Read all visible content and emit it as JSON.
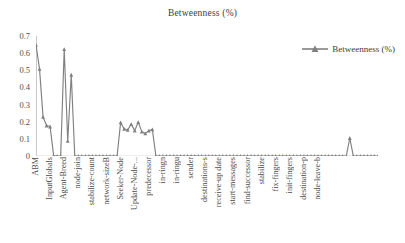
{
  "chart_data": {
    "type": "line",
    "title": "Betweenness (%)",
    "xlabel": "",
    "ylabel": "",
    "ylim": [
      0,
      0.7
    ],
    "ytick_values": [
      0,
      0.1,
      0.2,
      0.3,
      0.4,
      0.5,
      0.6,
      0.7
    ],
    "ytick_labels": [
      "0",
      "0.1",
      "0.2",
      "0.3",
      "0.4",
      "0.5",
      "0.6",
      "0.7"
    ],
    "grid": false,
    "legend_position": "top-right",
    "series": [
      {
        "name": "Betweenness (%)",
        "color": "#808080",
        "marker": "triangle",
        "values": [
          0.648,
          0.508,
          0.228,
          0.178,
          0.172,
          0.002,
          0.0,
          0.0,
          0.624,
          0.088,
          0.474,
          0.0,
          0.0,
          0.0,
          0.0,
          0.0,
          0.0,
          0.0,
          0.0,
          0.0,
          0.0,
          0.0,
          0.0,
          0.0,
          0.196,
          0.158,
          0.152,
          0.186,
          0.148,
          0.198,
          0.142,
          0.132,
          0.148,
          0.155,
          0.0,
          0.0,
          0.0,
          0.0,
          0.0,
          0.0,
          0.0,
          0.0,
          0.0,
          0.0,
          0.0,
          0.0,
          0.0,
          0.0,
          0.0,
          0.0,
          0.0,
          0.0,
          0.0,
          0.0,
          0.0,
          0.0,
          0.0,
          0.0,
          0.0,
          0.0,
          0.0,
          0.0,
          0.0,
          0.0,
          0.0,
          0.0,
          0.0,
          0.0,
          0.0,
          0.0,
          0.0,
          0.0,
          0.0,
          0.0,
          0.0,
          0.0,
          0.0,
          0.0,
          0.0,
          0.0,
          0.0,
          0.0,
          0.0,
          0.0,
          0.0,
          0.0,
          0.0,
          0.0,
          0.0,
          0.105,
          0.0,
          0.0,
          0.0,
          0.0,
          0.0,
          0.0,
          0.0,
          0.0
        ]
      }
    ],
    "xtick_labels": [
      "ABM",
      "InputGlobals",
      "Agent-Breed",
      "node-join",
      "stabilize-count",
      "network-sizeB",
      "Seeker-Node",
      "Update-Node-...",
      "predecessor",
      "in-ringn",
      "in-ringu",
      "sender",
      "destinations-s",
      "receive-up date",
      "start-messages",
      "find-successor",
      "stabilize",
      "fix-fingers",
      "init-fingers",
      "destination-p",
      "node-leave-b"
    ],
    "xtick_indices": [
      0,
      4,
      8,
      12,
      16,
      20,
      24,
      28,
      32,
      36,
      40,
      44,
      48,
      52,
      56,
      60,
      64,
      68,
      72,
      76,
      80
    ]
  },
  "legend": {
    "label": "Betweenness (%)"
  }
}
